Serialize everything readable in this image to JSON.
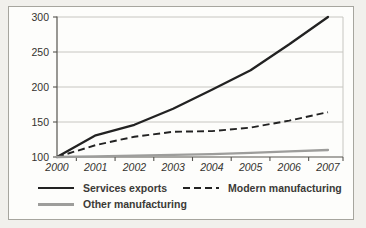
{
  "figure": {
    "outer_background": "#f1f0ec",
    "panel_background": "#fdfdfb",
    "panel_border_color": "#a6a59e",
    "gridline_color": "#c7c6c1",
    "axis_color": "#56544f",
    "tick_label_color": "#34322e"
  },
  "chart_data": {
    "type": "line",
    "title": "",
    "xlabel": "",
    "ylabel": "",
    "categories": [
      "2000",
      "2001",
      "2002",
      "2003",
      "2004",
      "2005",
      "2006",
      "2007"
    ],
    "series": [
      {
        "name": "Services exports",
        "color": "#222222",
        "style": "solid",
        "values": [
          100,
          131,
          146,
          169,
          196,
          224,
          261,
          300
        ]
      },
      {
        "name": "Modern manufacturing",
        "color": "#222222",
        "style": "dashed",
        "values": [
          100,
          117,
          129,
          136,
          137,
          142,
          152,
          164
        ]
      },
      {
        "name": "Other manufacturing",
        "color": "#9d9d9b",
        "style": "solid",
        "values": [
          100,
          101,
          102,
          103,
          104,
          106,
          108,
          110
        ]
      }
    ],
    "ylim": [
      100,
      300
    ],
    "y_ticks": [
      100,
      150,
      200,
      250,
      300
    ],
    "grid": true,
    "legend_position": "bottom-left"
  }
}
